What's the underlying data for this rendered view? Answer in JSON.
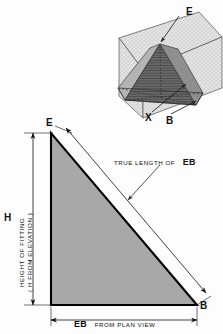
{
  "figure": {
    "title_implied": "True length of EB construction diagram",
    "colors": {
      "line": "#111111",
      "thin_line": "#6e6e6e",
      "triangle_fill": "#a8a8a8",
      "triangle_edge": "#000000",
      "plane_fill": "#d8d8d8",
      "pyramid_light": "#9a9a9a",
      "pyramid_dark": "#5c5c5c",
      "background": "#fdfdfd"
    },
    "pictorial": {
      "labels": {
        "apex": "E",
        "center": "X",
        "corner": "B"
      }
    },
    "construction": {
      "vertex_top": "E",
      "vertex_bottom_right": "B",
      "height_symbol": "H",
      "height_caption_line1": "HEIGHT OF FITTING",
      "height_caption_line2": "( H FROM ELEVATION )",
      "hypotenuse_caption_prefix": "TRUE LENGTH OF",
      "hypotenuse_caption_term": "EB",
      "base_caption_term": "EB",
      "base_caption_suffix": "FROM PLAN VIEW"
    }
  }
}
